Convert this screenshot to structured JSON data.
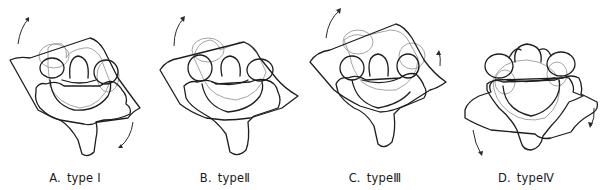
{
  "figure": {
    "panels": [
      {
        "id": "A",
        "letter": "A.",
        "label": "type Ⅰ",
        "description": "displaced vertebra rotated, arrows indicating counter rotation (top-left upward, bottom-right downward)"
      },
      {
        "id": "B",
        "letter": "B.",
        "label": "typeⅡ",
        "description": "displaced vertebra rotated, single arrow at top-left"
      },
      {
        "id": "C",
        "letter": "C.",
        "label": "typeⅢ",
        "description": "displaced vertebra rotated, arrows at top-left and right"
      },
      {
        "id": "D",
        "letter": "D.",
        "label": "typeⅣ",
        "description": "displaced vertebra tilted forward, arrows at bottom-left and bottom-right pointing downward"
      }
    ],
    "colors": {
      "outline_dark": "#1e1e1e",
      "outline_light": "#9a9a9a",
      "background": "#ffffff"
    }
  }
}
